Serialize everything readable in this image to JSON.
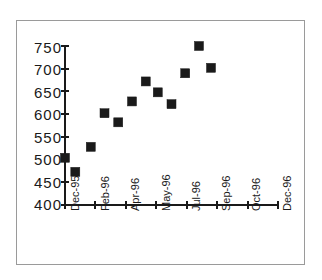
{
  "chart_data": {
    "type": "scatter",
    "title": "",
    "subtitle": "",
    "xlabel": "",
    "ylabel": "",
    "grid": false,
    "legend": false,
    "legend_position": "none",
    "marker": "filled-square",
    "marker_color": "#1a1a1a",
    "ylim": [
      400,
      750
    ],
    "yticks": [
      400,
      450,
      500,
      550,
      600,
      650,
      700,
      750
    ],
    "ytick_labels": [
      "400",
      "450",
      "500",
      "550",
      "600",
      "650",
      "700",
      "750"
    ],
    "xticks": [
      0,
      2,
      4,
      5,
      7,
      9,
      10,
      12
    ],
    "xtick_labels": [
      "Dec-95",
      "Feb-96",
      "Apr-96",
      "May-96",
      "Jul-96",
      "Sep-96",
      "Oct-96",
      "Dec-96"
    ],
    "xlim": [
      0,
      12.4
    ],
    "x": [
      0,
      0.6,
      1.5,
      2.3,
      3.1,
      3.9,
      4.7,
      5.4,
      6.2,
      7.0,
      7.8,
      8.5
    ],
    "values": [
      504,
      473,
      528,
      602,
      582,
      628,
      672,
      648,
      622,
      690,
      750,
      702
    ],
    "points": [
      {
        "label": "Dec-95",
        "x": 0.0,
        "y": 504
      },
      {
        "label": "Jan-96",
        "x": 0.6,
        "y": 473
      },
      {
        "label": "Feb-96",
        "x": 1.5,
        "y": 528
      },
      {
        "label": "Mar-96",
        "x": 2.3,
        "y": 602
      },
      {
        "label": "Apr-96",
        "x": 3.1,
        "y": 582
      },
      {
        "label": "May-96",
        "x": 3.9,
        "y": 628
      },
      {
        "label": "Jun-96",
        "x": 4.7,
        "y": 672
      },
      {
        "label": "Jul-96",
        "x": 5.4,
        "y": 648
      },
      {
        "label": "Aug-96",
        "x": 6.2,
        "y": 622
      },
      {
        "label": "Sep-96",
        "x": 7.0,
        "y": 690
      },
      {
        "label": "Oct-96",
        "x": 7.8,
        "y": 750
      },
      {
        "label": "Dec-96",
        "x": 8.5,
        "y": 702
      }
    ]
  },
  "axes": {
    "y_tick_0": "750",
    "y_tick_1": "700",
    "y_tick_2": "650",
    "y_tick_3": "600",
    "y_tick_4": "550",
    "y_tick_5": "500",
    "y_tick_6": "450",
    "y_tick_7": "400",
    "x_tick_0": "Dec-95",
    "x_tick_1": "Feb-96",
    "x_tick_2": "Apr-96",
    "x_tick_3": "May-96",
    "x_tick_4": "Jul-96",
    "x_tick_5": "Sep-96",
    "x_tick_6": "Oct-96",
    "x_tick_7": "Dec-96"
  },
  "colors": {
    "marker": "#1a1a1a",
    "axis": "#1a1a1a",
    "frame": "#9a9a9a",
    "background": "#ffffff"
  }
}
